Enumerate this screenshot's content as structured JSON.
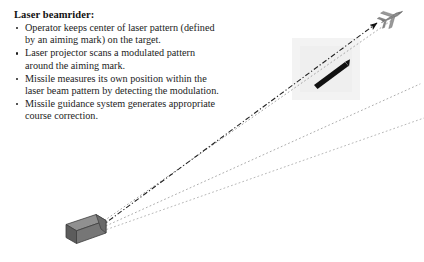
{
  "slide": {
    "title": "Laser beamrider:",
    "bullets": [
      "Operator keeps center of laser pattern (defined by an aiming mark) on the target.",
      "Laser projector scans a modulated pattern around the aiming mark.",
      "Missile measures its own position within the laser beam pattern by detecting the modulation.",
      "Missile guidance system generates appropriate course correction."
    ]
  },
  "diagram": {
    "type": "schematic",
    "background_color": "#ffffff",
    "elements": {
      "launcher": {
        "label": "laser-projector-launcher",
        "top_face_color": "#8e8e8e",
        "front_face_color": "#6f6f6f",
        "side_face_color": "#5a5a5a",
        "outline_color": "#3a3a3a"
      },
      "missile": {
        "label": "missile",
        "color": "#111111"
      },
      "target": {
        "label": "aircraft-target",
        "color": "#8a8a8a",
        "outline_color": "#5a5a5a"
      },
      "beam_center_line": {
        "label": "laser-beam-axis",
        "style": "dash-dot",
        "color": "#2b2b2b",
        "arrowhead": true
      },
      "beam_edges": {
        "label": "laser-beam-pattern-edges",
        "style": "dotted",
        "color": "#9a9a9a",
        "count": 3
      },
      "pattern_patch": {
        "label": "laser-pattern-region",
        "color": "#f2f2f2"
      }
    }
  }
}
